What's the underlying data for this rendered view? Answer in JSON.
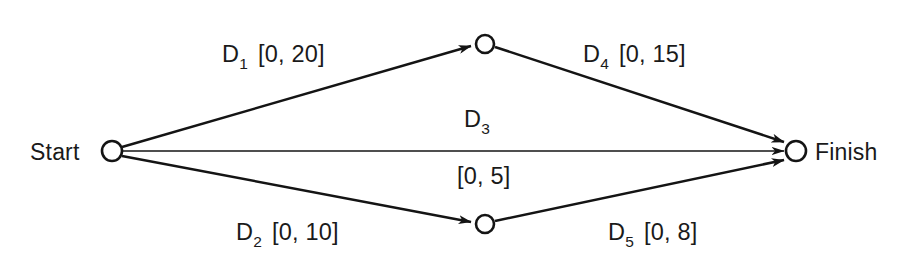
{
  "diagram": {
    "type": "activity-on-arrow-network",
    "background_color": "#ffffff",
    "line_color": "#141414",
    "text_color": "#1a1a1a",
    "nodes": [
      {
        "id": "start",
        "label": "Start",
        "label_side": "left",
        "cx": 112,
        "cy": 151,
        "r": 10
      },
      {
        "id": "top",
        "label": "",
        "label_side": "none",
        "cx": 485,
        "cy": 44,
        "r": 9
      },
      {
        "id": "bottom",
        "label": "",
        "label_side": "none",
        "cx": 485,
        "cy": 224,
        "r": 9
      },
      {
        "id": "finish",
        "label": "Finish",
        "label_side": "right",
        "cx": 796,
        "cy": 151,
        "r": 10
      }
    ],
    "arcs": [
      {
        "id": "d1",
        "activity": "D",
        "subscript": "1",
        "interval": "[0, 20]",
        "from": "start",
        "to": "top"
      },
      {
        "id": "d2",
        "activity": "D",
        "subscript": "2",
        "interval": "[0, 10]",
        "from": "start",
        "to": "bottom"
      },
      {
        "id": "d3",
        "activity": "D",
        "subscript": "3",
        "interval": "[0, 5]",
        "from": "start",
        "to": "finish"
      },
      {
        "id": "d4",
        "activity": "D",
        "subscript": "4",
        "interval": "[0, 15]",
        "from": "top",
        "to": "finish"
      },
      {
        "id": "d5",
        "activity": "D",
        "subscript": "5",
        "interval": "[0, 8]",
        "from": "bottom",
        "to": "finish"
      }
    ]
  },
  "labels": {
    "start_node": "Start",
    "finish_node": "Finish",
    "d1_name": "D",
    "d1_sub": "1",
    "d1_interval": "[0, 20]",
    "d2_name": "D",
    "d2_sub": "2",
    "d2_interval": "[0, 10]",
    "d3_name": "D",
    "d3_sub": "3",
    "d3_interval": "[0, 5]",
    "d4_name": "D",
    "d4_sub": "4",
    "d4_interval": "[0, 15]",
    "d5_name": "D",
    "d5_sub": "5",
    "d5_interval": "[0, 8]"
  }
}
